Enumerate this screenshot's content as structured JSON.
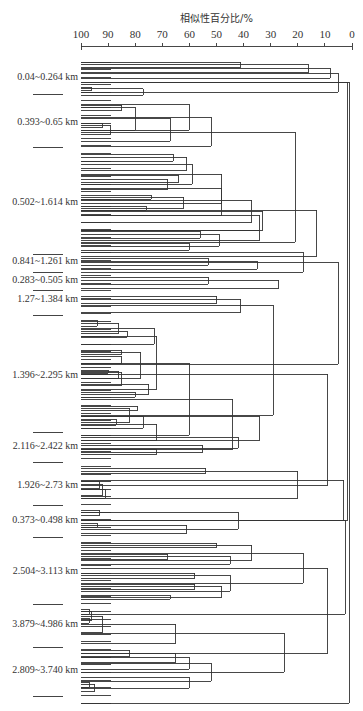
{
  "chart_data": {
    "type": "dendrogram",
    "title": "相似性百分比/%",
    "xlabel": "相似性百分比/%",
    "ylabel": "",
    "xlim": [
      100,
      0
    ],
    "x_axis_position": "top",
    "grid": false,
    "ticks": [
      100,
      90,
      80,
      70,
      60,
      50,
      40,
      30,
      20,
      10,
      0
    ],
    "axis_pixels": {
      "x100": 81,
      "x0": 352,
      "y": 46
    },
    "leaf_spacing_px": 7.6,
    "groups": [
      {
        "label": "0.04~0.264 km",
        "label_y": 78,
        "sep_y": 94,
        "leaves": 6
      },
      {
        "label": "0.393~0.65 km",
        "label_y": 123,
        "sep_y": 147,
        "leaves": 7
      },
      {
        "label": "0.502~1.614 km",
        "label_y": 203,
        "sep_y": 254,
        "leaves": 16
      },
      {
        "label": "0.841~1.261 km",
        "label_y": 262,
        "sep_y": 272,
        "leaves": 2
      },
      {
        "label": "0.283~0.505 km",
        "label_y": 281,
        "sep_y": 290,
        "leaves": 2
      },
      {
        "label": "1.27~1.384 km",
        "label_y": 300,
        "sep_y": 315,
        "leaves": 3
      },
      {
        "label": "1.396~2.295 km",
        "label_y": 376,
        "sep_y": 432,
        "leaves": 17
      },
      {
        "label": "2.116~2.422 km",
        "label_y": 447,
        "sep_y": 462,
        "leaves": 4
      },
      {
        "label": "1.926~2.73 km",
        "label_y": 486,
        "sep_y": 505,
        "leaves": 5
      },
      {
        "label": "0.373~0.498 km",
        "label_y": 521,
        "sep_y": 537,
        "leaves": 4
      },
      {
        "label": "2.504~3.113 km",
        "label_y": 572,
        "sep_y": 604,
        "leaves": 11
      },
      {
        "label": "3.879~4.986 km",
        "label_y": 625,
        "sep_y": 647,
        "leaves": 6
      },
      {
        "label": "2.809~3.740 km",
        "label_y": 671,
        "sep_y": 696,
        "leaves": 8
      }
    ],
    "merges_note": "segments = [similarity%, y_top, y_bottom] vertical joins; horizontals drawn from children",
    "segments": [
      {
        "s": 41,
        "y1": 62,
        "y2": 67
      },
      {
        "s": 16,
        "y1": 64.5,
        "y2": 72
      },
      {
        "s": 8,
        "y1": 68,
        "y2": 78
      },
      {
        "s": 96,
        "y1": 87,
        "y2": 90
      },
      {
        "s": 77,
        "y1": 88.5,
        "y2": 95
      },
      {
        "s": 5,
        "y1": 73,
        "y2": 92
      },
      {
        "s": 1.5,
        "y1": 82,
        "y2": 520
      },
      {
        "s": 85,
        "y1": 105,
        "y2": 110
      },
      {
        "s": 92,
        "y1": 123,
        "y2": 127
      },
      {
        "s": 89,
        "y1": 125,
        "y2": 134
      },
      {
        "s": 80,
        "y1": 107,
        "y2": 130
      },
      {
        "s": 67,
        "y1": 118,
        "y2": 141
      },
      {
        "s": 60,
        "y1": 104,
        "y2": 130
      },
      {
        "s": 52,
        "y1": 117,
        "y2": 146
      },
      {
        "s": 21,
        "y1": 132,
        "y2": 242
      },
      {
        "s": 66,
        "y1": 154,
        "y2": 161
      },
      {
        "s": 61,
        "y1": 157,
        "y2": 170
      },
      {
        "s": 64,
        "y1": 175,
        "y2": 182
      },
      {
        "s": 68,
        "y1": 179,
        "y2": 189
      },
      {
        "s": 59,
        "y1": 164,
        "y2": 184
      },
      {
        "s": 74,
        "y1": 195,
        "y2": 199
      },
      {
        "s": 76,
        "y1": 206,
        "y2": 210
      },
      {
        "s": 62,
        "y1": 197,
        "y2": 208
      },
      {
        "s": 48,
        "y1": 174,
        "y2": 203
      },
      {
        "s": 48,
        "y1": 188,
        "y2": 215
      },
      {
        "s": 37,
        "y1": 200,
        "y2": 222
      },
      {
        "s": 33,
        "y1": 211,
        "y2": 230
      },
      {
        "s": 34,
        "y1": 215,
        "y2": 230
      },
      {
        "s": 56,
        "y1": 231,
        "y2": 238
      },
      {
        "s": 60,
        "y1": 243,
        "y2": 250
      },
      {
        "s": 49,
        "y1": 234,
        "y2": 246
      },
      {
        "s": 34,
        "y1": 230,
        "y2": 240
      },
      {
        "s": 13,
        "y1": 210,
        "y2": 256
      },
      {
        "s": 53,
        "y1": 258,
        "y2": 265
      },
      {
        "s": 35,
        "y1": 261,
        "y2": 269
      },
      {
        "s": 53,
        "y1": 277,
        "y2": 284
      },
      {
        "s": 27,
        "y1": 280,
        "y2": 288
      },
      {
        "s": 18,
        "y1": 252,
        "y2": 272
      },
      {
        "s": 5,
        "y1": 262,
        "y2": 364
      },
      {
        "s": 50,
        "y1": 296,
        "y2": 303
      },
      {
        "s": 41,
        "y1": 299,
        "y2": 312
      },
      {
        "s": 29,
        "y1": 305,
        "y2": 415
      },
      {
        "s": 94,
        "y1": 320,
        "y2": 326
      },
      {
        "s": 83,
        "y1": 331,
        "y2": 337
      },
      {
        "s": 86,
        "y1": 323,
        "y2": 333
      },
      {
        "s": 73,
        "y1": 328,
        "y2": 344
      },
      {
        "s": 85,
        "y1": 350,
        "y2": 354
      },
      {
        "s": 85,
        "y1": 356,
        "y2": 363
      },
      {
        "s": 90,
        "y1": 370,
        "y2": 373
      },
      {
        "s": 86,
        "y1": 371,
        "y2": 378
      },
      {
        "s": 85,
        "y1": 372,
        "y2": 385
      },
      {
        "s": 78,
        "y1": 352,
        "y2": 378
      },
      {
        "s": 80,
        "y1": 392,
        "y2": 397
      },
      {
        "s": 75,
        "y1": 384,
        "y2": 394
      },
      {
        "s": 72,
        "y1": 336,
        "y2": 389
      },
      {
        "s": 79,
        "y1": 406,
        "y2": 410
      },
      {
        "s": 87,
        "y1": 419,
        "y2": 425
      },
      {
        "s": 82,
        "y1": 408,
        "y2": 422
      },
      {
        "s": 77,
        "y1": 416,
        "y2": 428
      },
      {
        "s": 72,
        "y1": 424,
        "y2": 440
      },
      {
        "s": 60,
        "y1": 363,
        "y2": 435
      },
      {
        "s": 44,
        "y1": 399,
        "y2": 449
      },
      {
        "s": 34,
        "y1": 416,
        "y2": 440
      },
      {
        "s": 72,
        "y1": 449,
        "y2": 454
      },
      {
        "s": 55,
        "y1": 445,
        "y2": 452
      },
      {
        "s": 42,
        "y1": 437,
        "y2": 448
      },
      {
        "s": 93,
        "y1": 481,
        "y2": 488
      },
      {
        "s": 92,
        "y1": 484,
        "y2": 495
      },
      {
        "s": 91,
        "y1": 489,
        "y2": 498
      },
      {
        "s": 54,
        "y1": 468,
        "y2": 473
      },
      {
        "s": 20,
        "y1": 471,
        "y2": 498
      },
      {
        "s": 9,
        "y1": 374,
        "y2": 485
      },
      {
        "s": 93,
        "y1": 510,
        "y2": 515
      },
      {
        "s": 94,
        "y1": 523,
        "y2": 527
      },
      {
        "s": 61,
        "y1": 525,
        "y2": 533
      },
      {
        "s": 42,
        "y1": 512,
        "y2": 529
      },
      {
        "s": 3,
        "y1": 480,
        "y2": 520
      },
      {
        "s": 50,
        "y1": 543,
        "y2": 547
      },
      {
        "s": 68,
        "y1": 554,
        "y2": 559
      },
      {
        "s": 45,
        "y1": 556,
        "y2": 564
      },
      {
        "s": 37,
        "y1": 545,
        "y2": 560
      },
      {
        "s": 58,
        "y1": 573,
        "y2": 578
      },
      {
        "s": 58,
        "y1": 584,
        "y2": 589
      },
      {
        "s": 67,
        "y1": 595,
        "y2": 599
      },
      {
        "s": 48,
        "y1": 586,
        "y2": 597
      },
      {
        "s": 45,
        "y1": 575,
        "y2": 591
      },
      {
        "s": 18,
        "y1": 553,
        "y2": 583
      },
      {
        "s": 97,
        "y1": 609,
        "y2": 614
      },
      {
        "s": 97,
        "y1": 618,
        "y2": 623
      },
      {
        "s": 96,
        "y1": 611,
        "y2": 620
      },
      {
        "s": 92,
        "y1": 616,
        "y2": 632
      },
      {
        "s": 65,
        "y1": 624,
        "y2": 643
      },
      {
        "s": 82,
        "y1": 650,
        "y2": 656
      },
      {
        "s": 65,
        "y1": 653,
        "y2": 662
      },
      {
        "s": 60,
        "y1": 657,
        "y2": 669
      },
      {
        "s": 52,
        "y1": 663,
        "y2": 681
      },
      {
        "s": 97,
        "y1": 682,
        "y2": 687
      },
      {
        "s": 95,
        "y1": 684,
        "y2": 691
      },
      {
        "s": 60,
        "y1": 677,
        "y2": 688
      },
      {
        "s": 25,
        "y1": 633,
        "y2": 672
      },
      {
        "s": 9,
        "y1": 568,
        "y2": 653
      },
      {
        "s": 2.5,
        "y1": 520,
        "y2": 614
      },
      {
        "s": 1,
        "y1": 82,
        "y2": 703
      }
    ]
  }
}
